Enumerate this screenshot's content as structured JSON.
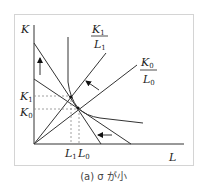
{
  "diagram": {
    "y_axis_label": "K",
    "x_axis_label": "L",
    "ray1": {
      "num": "K",
      "num_sub": "1",
      "den": "L",
      "den_sub": "1"
    },
    "ray0": {
      "num": "K",
      "num_sub": "0",
      "den": "L",
      "den_sub": "0"
    },
    "y_ticks": [
      {
        "label": "K",
        "sub": "1"
      },
      {
        "label": "K",
        "sub": "0"
      }
    ],
    "x_ticks": [
      {
        "label": "L",
        "sub": "1"
      },
      {
        "label": "L",
        "sub": "0"
      }
    ],
    "caption": "(a) σ が小"
  }
}
